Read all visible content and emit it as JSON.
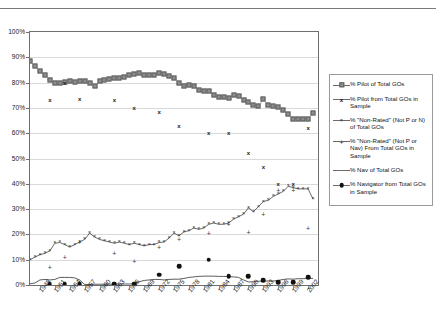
{
  "top_cropped_text": "",
  "chart_data": {
    "type": "line",
    "title": "",
    "xlabel": "",
    "ylabel": "",
    "ylim": [
      0,
      100
    ],
    "ytick_labels": [
      "100%",
      "90%",
      "80%",
      "70%",
      "60%",
      "50%",
      "40%",
      "30%",
      "20%",
      "10%",
      "0%"
    ],
    "ytick_values": [
      100,
      90,
      80,
      70,
      60,
      50,
      40,
      30,
      20,
      10,
      0
    ],
    "grid": true,
    "legend_position": "right",
    "xlim": [
      1946,
      2004
    ],
    "xtick_labels": [
      "1948",
      "1951",
      "1954",
      "1957",
      "1960",
      "1963",
      "1966",
      "1969",
      "1972",
      "1975",
      "1978",
      "1981",
      "1984",
      "1987",
      "1990",
      "1993",
      "1996",
      "1999",
      "2002"
    ],
    "xtick_values": [
      1948,
      1951,
      1954,
      1957,
      1960,
      1963,
      1966,
      1969,
      1972,
      1975,
      1978,
      1981,
      1984,
      1987,
      1990,
      1993,
      1996,
      1999,
      2002
    ],
    "x_all_years": [
      1946,
      1947,
      1948,
      1949,
      1950,
      1951,
      1952,
      1953,
      1954,
      1955,
      1956,
      1957,
      1958,
      1959,
      1960,
      1961,
      1962,
      1963,
      1964,
      1965,
      1966,
      1967,
      1968,
      1969,
      1970,
      1971,
      1972,
      1973,
      1974,
      1975,
      1976,
      1977,
      1978,
      1979,
      1980,
      1981,
      1982,
      1983,
      1984,
      1985,
      1986,
      1987,
      1988,
      1989,
      1990,
      1991,
      1992,
      1993,
      1994,
      1995,
      1996,
      1997,
      1998,
      1999,
      2000,
      2001,
      2002,
      2003
    ],
    "series": [
      {
        "name": "% Pilot of Total GOs",
        "marker": "square",
        "style": "line-marker",
        "color": "#8d8d8d",
        "x": [
          1946,
          1947,
          1948,
          1949,
          1950,
          1951,
          1952,
          1953,
          1954,
          1955,
          1956,
          1957,
          1958,
          1959,
          1960,
          1961,
          1962,
          1963,
          1964,
          1965,
          1966,
          1967,
          1968,
          1969,
          1970,
          1971,
          1972,
          1973,
          1974,
          1975,
          1976,
          1977,
          1978,
          1979,
          1980,
          1981,
          1982,
          1983,
          1984,
          1985,
          1986,
          1987,
          1988,
          1989,
          1990,
          1991,
          1992,
          1993,
          1994,
          1995,
          1996,
          1997,
          1998,
          1999,
          2000,
          2001,
          2002,
          2003
        ],
        "values": [
          88.5,
          86.5,
          84.5,
          83.0,
          81.2,
          80.0,
          79.8,
          80.2,
          80.5,
          80.3,
          80.8,
          80.6,
          79.8,
          78.6,
          80.5,
          81.0,
          81.5,
          81.8,
          82.0,
          82.3,
          83.0,
          83.5,
          83.8,
          83.2,
          83.0,
          83.2,
          83.6,
          83.5,
          82.8,
          82.0,
          80.0,
          78.8,
          79.0,
          78.8,
          77.0,
          76.8,
          76.6,
          75.0,
          74.4,
          74.2,
          74.0,
          75.0,
          74.8,
          73.0,
          72.2,
          71.0,
          70.6,
          73.5,
          71.0,
          70.8,
          70.2,
          69.0,
          67.5,
          65.8,
          65.6,
          65.8,
          65.5,
          68.0
        ]
      },
      {
        "name": "% Pilot from Total GOs in Sample",
        "marker": "x-square",
        "style": "markers",
        "color": "#1a1a1a",
        "x": [
          1950,
          1953,
          1956,
          1963,
          1967,
          1972,
          1976,
          1982,
          1986,
          1990,
          1993,
          1996,
          1999,
          2002
        ],
        "values": [
          73.0,
          80.0,
          73.5,
          73.0,
          70.0,
          68.5,
          63.0,
          60.0,
          60.0,
          52.0,
          46.5,
          40.0,
          40.0,
          62.0
        ]
      },
      {
        "name": "% \"Non-Rated\" (Not P or N) of Total GOs",
        "marker": "x",
        "style": "line-marker",
        "color": "#2a2a2a",
        "x": [
          1946,
          1947,
          1948,
          1949,
          1950,
          1951,
          1952,
          1953,
          1954,
          1955,
          1956,
          1957,
          1958,
          1959,
          1960,
          1961,
          1962,
          1963,
          1964,
          1965,
          1966,
          1967,
          1968,
          1969,
          1970,
          1971,
          1972,
          1973,
          1974,
          1975,
          1976,
          1977,
          1978,
          1979,
          1980,
          1981,
          1982,
          1983,
          1984,
          1985,
          1986,
          1987,
          1988,
          1989,
          1990,
          1991,
          1992,
          1993,
          1994,
          1995,
          1996,
          1997,
          1998,
          1999,
          2000,
          2001,
          2002,
          2003
        ],
        "values": [
          10.0,
          11.0,
          12.0,
          12.5,
          13.5,
          16.5,
          16.8,
          16.0,
          15.0,
          16.0,
          17.0,
          18.0,
          20.5,
          19.0,
          18.0,
          17.5,
          17.0,
          16.5,
          17.0,
          16.5,
          16.0,
          16.5,
          16.0,
          15.5,
          16.0,
          16.0,
          16.8,
          17.0,
          18.5,
          20.5,
          19.5,
          21.0,
          21.5,
          22.5,
          22.0,
          22.5,
          24.0,
          24.5,
          24.0,
          24.0,
          24.5,
          26.0,
          27.0,
          28.0,
          30.5,
          29.0,
          31.0,
          33.0,
          33.5,
          35.0,
          36.0,
          37.0,
          39.0,
          38.5,
          38.0,
          38.0,
          38.0,
          34.0
        ]
      },
      {
        "name": "% \"Non-Rated\" (Not P or Nav) From Total GOs in Sample",
        "marker": "plus",
        "style": "markers",
        "color": "#3a3a3a",
        "x": [
          1950,
          1953,
          1956,
          1963,
          1967,
          1972,
          1976,
          1982,
          1986,
          1990,
          1993,
          1996,
          1999,
          2002
        ],
        "values": [
          7.0,
          11.0,
          17.0,
          12.5,
          9.5,
          15.0,
          18.0,
          20.5,
          24.0,
          21.0,
          28.0,
          37.5,
          37.5,
          22.5
        ]
      },
      {
        "name": "% Nav of Total GOs",
        "marker": "none",
        "style": "line",
        "color": "#4a4a4a",
        "x": [
          1946,
          1947,
          1948,
          1949,
          1950,
          1951,
          1952,
          1953,
          1954,
          1955,
          1956,
          1957,
          1958,
          1959,
          1960,
          1961,
          1962,
          1963,
          1964,
          1965,
          1966,
          1967,
          1968,
          1969,
          1970,
          1971,
          1972,
          1973,
          1974,
          1975,
          1976,
          1977,
          1978,
          1979,
          1980,
          1981,
          1982,
          1983,
          1984,
          1985,
          1986,
          1987,
          1988,
          1989,
          1990,
          1991,
          1992,
          1993,
          1994,
          1995,
          1996,
          1997,
          1998,
          1999,
          2000,
          2001,
          2002,
          2003
        ],
        "values": [
          0.5,
          0.8,
          2.0,
          2.2,
          2.0,
          2.2,
          3.0,
          3.0,
          3.0,
          2.8,
          2.0,
          0.2,
          0.2,
          0.3,
          0.3,
          0.3,
          0.3,
          0.3,
          0.4,
          0.4,
          0.4,
          0.5,
          1.3,
          1.8,
          2.0,
          2.2,
          2.2,
          2.0,
          2.2,
          2.3,
          2.3,
          2.6,
          3.0,
          3.2,
          3.4,
          3.5,
          3.5,
          3.5,
          3.4,
          3.4,
          3.3,
          3.2,
          3.0,
          2.0,
          1.2,
          1.3,
          1.5,
          1.5,
          1.6,
          1.6,
          1.8,
          2.2,
          2.4,
          2.3,
          2.5,
          2.5,
          2.6,
          2.6
        ]
      },
      {
        "name": "% Navigator from Total GOs in Sample",
        "marker": "dot",
        "style": "markers",
        "color": "#111111",
        "x": [
          1950,
          1953,
          1956,
          1963,
          1967,
          1972,
          1976,
          1982,
          1986,
          1990,
          1993,
          1996,
          1999,
          2002
        ],
        "values": [
          0.5,
          0.5,
          0.5,
          0.5,
          0.5,
          4.0,
          7.5,
          10.0,
          3.5,
          3.5,
          2.0,
          1.0,
          1.0,
          3.0
        ]
      }
    ]
  },
  "legend": {
    "items": [
      {
        "key": "square-marker-icon",
        "label": "% Pilot of Total GOs"
      },
      {
        "key": "x-square-marker-icon",
        "label": "% Pilot from Total GOs in Sample"
      },
      {
        "key": "x-marker-icon",
        "label": "% \"Non-Rated\" (Not P or N) of Total GOs"
      },
      {
        "key": "plus-marker-icon",
        "label": "% \"Non-Rated\" (Not P or Nav) From Total GOs in Sample"
      },
      {
        "key": "line-marker-icon",
        "label": "% Nav of Total GOs"
      },
      {
        "key": "dot-marker-icon",
        "label": "% Navigator from Total GOs in Sample"
      }
    ]
  }
}
